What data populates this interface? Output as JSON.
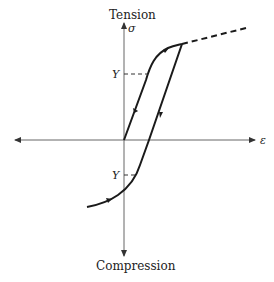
{
  "diagram": {
    "type": "stress-strain hysteresis",
    "labels": {
      "top": "Tension",
      "bottom": "Compression",
      "y_axis_symbol": "σ",
      "x_axis_symbol": "ε",
      "yield_upper": "Y",
      "yield_lower": "Y"
    },
    "colors": {
      "line": "#1a1a1a",
      "axis": "#555555",
      "background": "#ffffff"
    }
  }
}
